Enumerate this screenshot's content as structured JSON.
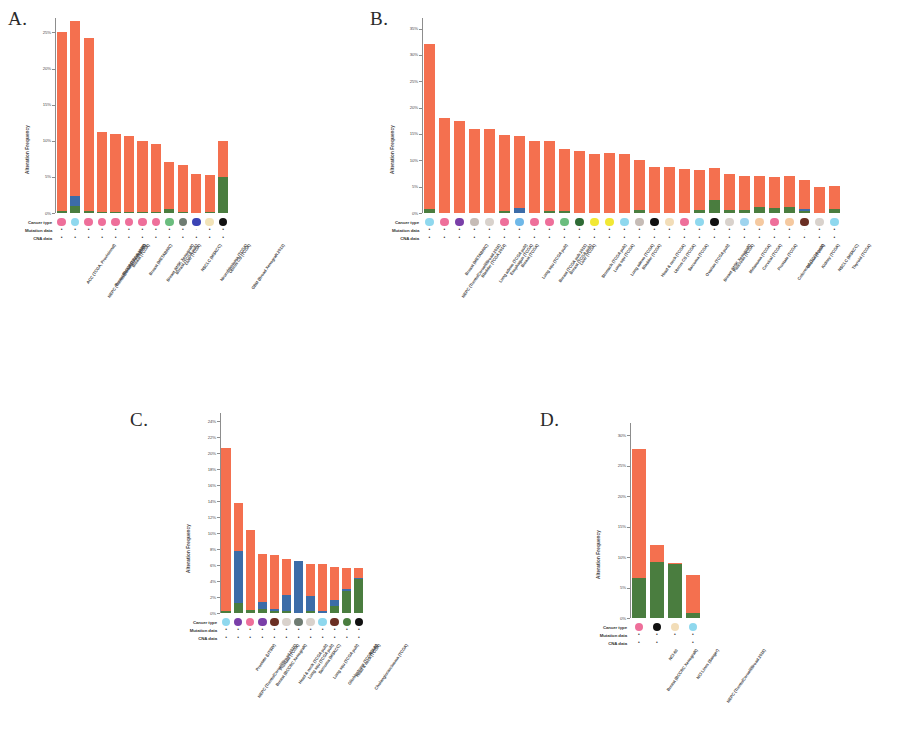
{
  "figure": {
    "panels": [
      "A.",
      "B.",
      "C.",
      "D."
    ],
    "axis_title": "Alteration Frequency",
    "annotation_rows": [
      "Cancer type",
      "Mutation data",
      "CNA data"
    ],
    "colors": {
      "amplification": "#f4704f",
      "deletion": "#3c6ca8",
      "mutation": "#4a7d3f",
      "multiple": "#7a57a8",
      "axis": "#8d8d8d",
      "text": "#3b3b3b"
    }
  },
  "chart_data": [
    {
      "panel": "A.",
      "type": "bar",
      "title": "",
      "ylabel": "Alteration Frequency",
      "xlabel": "",
      "ylim": [
        0,
        27
      ],
      "yticks": [
        "0%",
        "5%",
        "10%",
        "15%",
        "20%",
        "25%"
      ],
      "ytick_values": [
        0,
        5,
        10,
        15,
        20,
        25
      ],
      "grid": false,
      "legend": "none",
      "categories": [
        "ACC (TCGA, Provisional)",
        "NEPC (Trento/Cornell/Broad 2016)",
        "Breast (BCCRC Xenograft)",
        "Breast (TCGA 2015)",
        "Breast (TCGA)",
        "Breast (METABRIC)",
        "Breast (MSK Xenograft)",
        "Breast (TCGA pub)",
        "Liver (TCGA)",
        "NSCLC (MSKCC)",
        "Neuroblastoma (TCGA)",
        "Uterus CS (TCGA)",
        "GBM (Broad Xenograft 2013)"
      ],
      "series": [
        {
          "name": "Amplification",
          "color": "#f4704f",
          "values": [
            24.8,
            24.2,
            23.9,
            11.0,
            10.8,
            10.5,
            9.8,
            9.4,
            6.6,
            6.5,
            5.4,
            5.0,
            5.0
          ]
        },
        {
          "name": "Deletion",
          "color": "#3c6ca8",
          "values": [
            0,
            1.4,
            0,
            0,
            0,
            0,
            0,
            0,
            0,
            0,
            0,
            0,
            0
          ]
        },
        {
          "name": "Mutation",
          "color": "#4a7d3f",
          "values": [
            0.3,
            1.0,
            0.3,
            0.2,
            0.2,
            0.2,
            0.2,
            0.2,
            0.5,
            0.2,
            0,
            0.2,
            5.0
          ]
        }
      ],
      "bar_totals": [
        25.0,
        24.5,
        24.0,
        11.0,
        10.8,
        10.5,
        9.8,
        9.4,
        6.8,
        6.5,
        5.4,
        5.0,
        5.0
      ],
      "annotations": {
        "cancer_type_colors": [
          "#ee6f9a",
          "#8fd8ee",
          "#ee6f9a",
          "#ee6f9a",
          "#ee6f9a",
          "#ee6f9a",
          "#ee6f9a",
          "#ee6f9a",
          "#6bbd7e",
          "#6f7c72",
          "#3b44b5",
          "#f2e3b8",
          "#111111",
          "#111111"
        ],
        "mutation_data": [
          "+",
          "+",
          "+",
          "+",
          "+",
          "+",
          "+",
          "+",
          "+",
          "+",
          "-",
          "+",
          "+",
          "+"
        ],
        "cna_data": [
          "+",
          "+",
          "+",
          "+",
          "+",
          "+",
          "+",
          "+",
          "+",
          "+",
          "+",
          "+",
          "+",
          "-"
        ]
      }
    },
    {
      "panel": "B.",
      "type": "bar",
      "title": "",
      "ylabel": "Alteration Frequency",
      "xlabel": "",
      "ylim": [
        0,
        37
      ],
      "yticks": [
        "0%",
        "5%",
        "10%",
        "15%",
        "20%",
        "25%",
        "30%",
        "35%"
      ],
      "ytick_values": [
        0,
        5,
        10,
        15,
        20,
        25,
        30,
        35
      ],
      "grid": false,
      "legend": "none",
      "categories": [
        "NEPC (Trento/Cornell/Broad 2016)",
        "Breast (METABRIC)",
        "Bladder (TCGA 2014)",
        "Lung adeno (TCGA pub)",
        "Esophagus (TCGA)",
        "Breast (TCGA)",
        "Lung squ (TCGA pub)",
        "Breast (TCGA pub 2015)",
        "Breast (TCGA pub)",
        "Liver (TCGA)",
        "Stomach (TCGA pub)",
        "Lung squ (TCGA)",
        "Lung adeno (TCGA)",
        "Bladder (TCGA)",
        "Head & neck (TCGA)",
        "Uterus CS (TCGA)",
        "Sarcoma (TCGA)",
        "Ovarian (TCGA pub)",
        "Breast (MSK Xenograft)",
        "Pancreas (TCGA)",
        "Melanoma (TCGA)",
        "Cervical (TCGA)",
        "Prostate (TCGA)",
        "Colorectal (TCGA pub)",
        "Glioma (TCGA)",
        "Kidney (TCGA)",
        "NSCLC (MSKCC)",
        "Thyroid (TCGA)"
      ],
      "series": [
        {
          "name": "Amplification",
          "color": "#f4704f",
          "values": [
            31.3,
            18.1,
            17.5,
            15.9,
            15.9,
            14.5,
            13.7,
            13.6,
            13.3,
            11.8,
            11.7,
            11.2,
            11.3,
            11.2,
            9.4,
            8.8,
            8.8,
            8.4,
            7.6,
            6.0,
            6.9,
            6.6,
            6.0,
            5.8,
            5.8,
            5.6,
            5.0,
            4.4
          ]
        },
        {
          "name": "Deletion",
          "color": "#3c6ca8",
          "values": [
            0,
            0,
            0,
            0,
            0,
            0,
            0.9,
            0,
            0,
            0,
            0,
            0,
            0,
            0,
            0,
            0,
            0,
            0,
            0,
            0,
            0,
            0,
            0,
            0,
            0,
            0.3,
            0,
            0
          ]
        },
        {
          "name": "Mutation",
          "color": "#4a7d3f",
          "values": [
            0.8,
            0,
            0,
            0,
            0,
            0.4,
            0,
            0,
            0.4,
            0.4,
            0,
            0,
            0,
            0,
            0.6,
            0,
            0,
            0,
            0.6,
            2.5,
            0.5,
            0.5,
            1.1,
            1.0,
            1.2,
            0.4,
            0,
            0.8
          ]
        }
      ],
      "bar_totals": [
        32.1,
        18.1,
        17.5,
        15.9,
        15.9,
        14.9,
        14.6,
        13.6,
        13.7,
        12.2,
        11.7,
        11.2,
        11.3,
        11.2,
        10.0,
        8.8,
        8.8,
        8.4,
        8.2,
        8.5,
        7.4,
        7.1,
        7.1,
        6.8,
        7.0,
        6.3,
        5.0,
        5.2
      ],
      "annotations": {
        "cancer_type_colors": [
          "#8fd8ee",
          "#ee6f9a",
          "#7a3fa8",
          "#c6bcb6",
          "#d9d2cc",
          "#ee6f9a",
          "#6fb8e8",
          "#ee6f9a",
          "#ee6f9a",
          "#6bbd7e",
          "#2f6b35",
          "#f2e834",
          "#f2e834",
          "#8fd8ee",
          "#c6bcb6",
          "#111111",
          "#f2ddb8",
          "#ee6f9a",
          "#8fd8ee",
          "#111111",
          "#d9d2cc",
          "#9fd4ee",
          "#f5c9a0",
          "#ee6f9a",
          "#f5c9a0",
          "#6b2f23",
          "#d9d2cc",
          "#8fd8ee",
          "#8fd8ee"
        ],
        "mutation_data": [
          "+",
          "+",
          "+",
          "+",
          "+",
          "+",
          "+",
          "+",
          "+",
          "+",
          "+",
          "+",
          "+",
          "+",
          "+",
          "+",
          "+",
          "+",
          "+",
          "+",
          "+",
          "+",
          "+",
          "+",
          "+",
          "-",
          "+",
          "+",
          "+"
        ],
        "cna_data": [
          "+",
          "+",
          "+",
          "+",
          "+",
          "+",
          "+",
          "+",
          "+",
          "+",
          "+",
          "+",
          "+",
          "+",
          "+",
          "+",
          "+",
          "+",
          "+",
          "+",
          "+",
          "+",
          "+",
          "+",
          "+",
          "+",
          "+",
          "+",
          "+"
        ]
      }
    },
    {
      "panel": "C.",
      "type": "bar",
      "title": "",
      "ylabel": "Alteration Frequency",
      "xlabel": "",
      "ylim": [
        0,
        25
      ],
      "yticks": [
        "0%",
        "2%",
        "4%",
        "6%",
        "8%",
        "10%",
        "12%",
        "14%",
        "16%",
        "18%",
        "20%",
        "22%",
        "24%"
      ],
      "ytick_values": [
        0,
        2,
        4,
        6,
        8,
        10,
        12,
        14,
        16,
        18,
        20,
        22,
        24
      ],
      "grid": false,
      "legend": "none",
      "categories": [
        "NEPC (Trento/Cornell/Broad 2016)",
        "Prostate (UTSW)",
        "Breast (BCCRC Xenograft)",
        "Prostate (TCGA)",
        "Head & neck (TCGA pub)",
        "Lung squ (TCGA pub)",
        "Sarcoma (MSKCC)",
        "Lung squ (TCGA pub)",
        "Glioblastoma (TCGA pub)",
        "Head & neck (TCGA)",
        "Cholangiocarcinoma (TCGA)",
        "NCI-60"
      ],
      "series": [
        {
          "name": "Amplification",
          "color": "#f4704f",
          "values": [
            20.3,
            5.9,
            10.0,
            6.0,
            6.7,
            4.4,
            0,
            4.0,
            5.9,
            4.2,
            2.6,
            1.2
          ]
        },
        {
          "name": "Deletion",
          "color": "#3c6ca8",
          "values": [
            0,
            6.6,
            0,
            0.9,
            0.3,
            2.1,
            6.5,
            1.8,
            0.2,
            0.7,
            0.2,
            0.2
          ]
        },
        {
          "name": "Mutation",
          "color": "#4a7d3f",
          "values": [
            0.3,
            1.2,
            0.4,
            0.5,
            0.2,
            0.2,
            0,
            0.3,
            0,
            0.9,
            2.8,
            4.2
          ]
        }
      ],
      "bar_totals": [
        20.6,
        13.7,
        10.4,
        7.4,
        7.2,
        6.7,
        6.5,
        6.1,
        6.1,
        5.8,
        5.6,
        5.6
      ],
      "annotations": {
        "cancer_type_colors": [
          "#8fd8ee",
          "#7a3fa8",
          "#ee6f9a",
          "#7a3fa8",
          "#6b2f23",
          "#d9d2cc",
          "#6f7c72",
          "#d9d2cc",
          "#8fd8ee",
          "#6b2f23",
          "#4a7d3f",
          "#111111"
        ],
        "mutation_data": [
          "+",
          "+",
          "+",
          "+",
          "+",
          "+",
          "+",
          "+",
          "+",
          "+",
          "+",
          "+"
        ],
        "cna_data": [
          "+",
          "+",
          "+",
          "+",
          "+",
          "+",
          "+",
          "+",
          "+",
          "+",
          "+",
          "+"
        ]
      }
    },
    {
      "panel": "D.",
      "type": "bar",
      "title": "",
      "ylabel": "Alteration Frequency",
      "xlabel": "",
      "ylim": [
        0,
        32
      ],
      "yticks": [
        "0%",
        "5%",
        "10%",
        "15%",
        "20%",
        "25%",
        "30%"
      ],
      "ytick_values": [
        0,
        5,
        10,
        15,
        20,
        25,
        30
      ],
      "grid": false,
      "legend": "none",
      "categories": [
        "Breast (BCCRC Xenograft)",
        "NCI-60",
        "NCI Lines (Sanger)",
        "NEPC (Trento/Cornell/Broad 2016)"
      ],
      "series": [
        {
          "name": "Amplification",
          "color": "#f4704f",
          "values": [
            21.2,
            2.8,
            0.3,
            6.3
          ]
        },
        {
          "name": "Mutation",
          "color": "#4a7d3f",
          "values": [
            6.6,
            9.2,
            8.8,
            0.8
          ]
        }
      ],
      "bar_totals": [
        27.8,
        12.0,
        9.1,
        7.1
      ],
      "annotations": {
        "cancer_type_colors": [
          "#ee6f9a",
          "#111111",
          "#f2ddb8",
          "#8fd8ee"
        ],
        "mutation_data": [
          "+",
          "+",
          "+",
          "+"
        ],
        "cna_data": [
          "+",
          "+",
          "",
          "+"
        ]
      }
    }
  ]
}
